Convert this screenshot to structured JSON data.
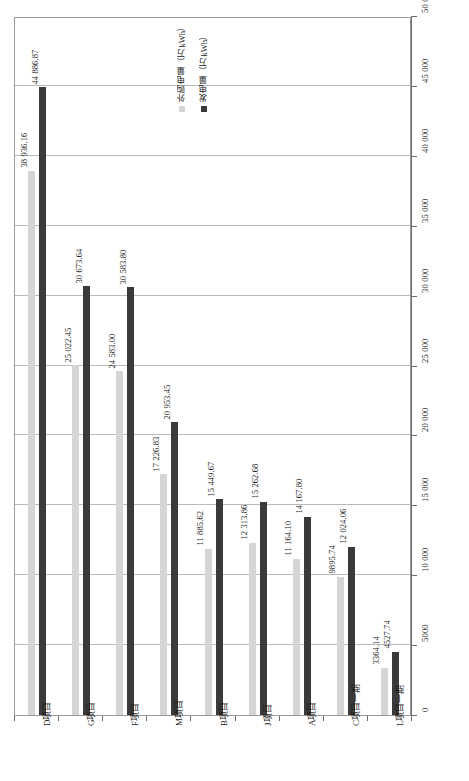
{
  "chart_data": {
    "type": "bar",
    "title": "",
    "subtitle": "",
    "xlabel": "",
    "ylabel": "",
    "orientation": "vertical-columns-rotated",
    "grid": true,
    "legend_position": "top-center",
    "ylim": [
      0,
      50000
    ],
    "ytick_step": 5000,
    "categories": [
      "D项目",
      "G项目",
      "F项目",
      "M项目",
      "B项目",
      "J项目",
      "A项目",
      "C项目一期",
      "L项目一期"
    ],
    "tick_labels": [
      "0",
      "5000",
      "10 000",
      "15 000",
      "20 000",
      "25 000",
      "30 000",
      "35 000",
      "40 000",
      "45 000",
      "50 000"
    ],
    "tick_values": [
      0,
      5000,
      10000,
      15000,
      20000,
      25000,
      30000,
      35000,
      40000,
      45000,
      50000
    ],
    "series": [
      {
        "name": "外购电量（万kWh）",
        "color": "#d5d5d5",
        "values": [
          38936.16,
          25022.45,
          24583.0,
          17226.83,
          11885.62,
          12313.86,
          11164.1,
          9895.74,
          3364.14
        ],
        "labels": [
          "38 936.16",
          "25 022.45",
          "24 583.00",
          "17 226.83",
          "11 885.62",
          "12 313.86",
          "11 164.10",
          "9895.74",
          "3364.14"
        ]
      },
      {
        "name": "发电量（万kWh）",
        "color": "#3a3a3a",
        "values": [
          44886.87,
          30673.64,
          30583.8,
          20953.45,
          15449.67,
          15262.68,
          14167.8,
          12024.06,
          4527.74
        ],
        "labels": [
          "44 886.87",
          "30 673.64",
          "30 583.80",
          "20 953.45",
          "15 449.67",
          "15 262.68",
          "14 167.80",
          "12 024.06",
          "4527.74"
        ]
      }
    ]
  }
}
